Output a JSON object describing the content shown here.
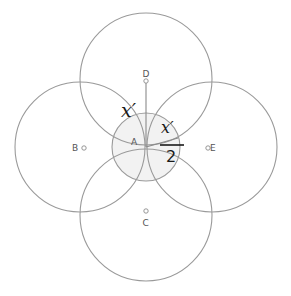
{
  "diagram": {
    "colors": {
      "stroke": "#9a9a9a",
      "center_fill": "#f2f2f2",
      "label_text": "#555555",
      "math_text": "#1a1a1a"
    },
    "points": {
      "A": {
        "label": "A"
      },
      "B": {
        "label": "B"
      },
      "C": {
        "label": "C"
      },
      "D": {
        "label": "D"
      },
      "E": {
        "label": "E"
      }
    },
    "annotations": {
      "radius_label": "x′",
      "half_numerator": "x′",
      "half_denominator": "2"
    }
  }
}
